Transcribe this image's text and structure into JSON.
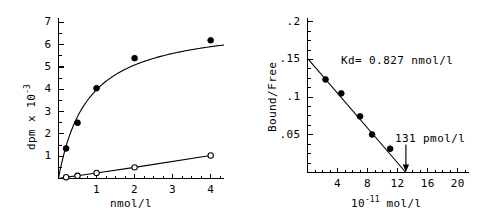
{
  "figure": {
    "background_color": "#ffffff",
    "ink_color": "#000000"
  },
  "chart_data": [
    {
      "type": "scatter",
      "panel_name": "saturation-binding-curve",
      "title": "",
      "xlabel": "nmol/l",
      "ylabel": "dpm x 10",
      "ylabel_exponent": "-3",
      "xlim": [
        0,
        4.35
      ],
      "ylim": [
        0,
        7.2
      ],
      "xticks": [
        1,
        2,
        3,
        4
      ],
      "xtick_labels": [
        "1",
        "2",
        "3",
        "4"
      ],
      "yticks": [
        1,
        2,
        3,
        4,
        5,
        6,
        7
      ],
      "ytick_labels": [
        "1",
        "2",
        "3",
        "4",
        "5",
        "6",
        "7"
      ],
      "grid": false,
      "legend": "none",
      "series": [
        {
          "name": "total-binding",
          "marker": "filled-circle",
          "x": [
            0.2,
            0.5,
            1.0,
            2.0,
            4.0
          ],
          "values": [
            1.35,
            2.5,
            4.05,
            5.4,
            6.2
          ]
        },
        {
          "name": "nonspecific-binding",
          "marker": "open-circle",
          "x": [
            0.2,
            0.5,
            1.0,
            2.0,
            4.0
          ],
          "values": [
            0.06,
            0.12,
            0.25,
            0.5,
            1.03
          ]
        }
      ]
    },
    {
      "type": "scatter",
      "panel_name": "scatchard-plot",
      "title": "",
      "xlabel": "10",
      "xlabel_exponent": "-11",
      "xlabel_units": "mol/l",
      "ylabel": "Bound/Free",
      "xlim": [
        0,
        21.5
      ],
      "ylim": [
        0,
        0.205
      ],
      "xticks": [
        4,
        8,
        12,
        16,
        20
      ],
      "xtick_labels": [
        "4",
        "8",
        "12",
        "16",
        "20"
      ],
      "yticks": [
        0.05,
        0.1,
        0.15,
        0.2
      ],
      "ytick_labels": [
        ".05",
        ".1",
        ".15",
        ".2"
      ],
      "grid": false,
      "legend": "none",
      "series": [
        {
          "name": "scatchard-points",
          "marker": "filled-circle",
          "x": [
            2.4,
            4.5,
            7.0,
            8.6,
            11.0
          ],
          "values": [
            0.1235,
            0.105,
            0.0745,
            0.0505,
            0.0315
          ]
        }
      ],
      "fit_line": {
        "name": "regression-line",
        "x_start": 0.0,
        "y_start": 0.1515,
        "x_end": 13.1,
        "y_end": 0.0
      },
      "annotations": [
        {
          "name": "kd-annotation",
          "text": "Kd= 0.827 nmol/l"
        },
        {
          "name": "xintercept-annotation",
          "text": "131 pmol/l",
          "arrow_target_x": 13.1
        }
      ]
    }
  ]
}
